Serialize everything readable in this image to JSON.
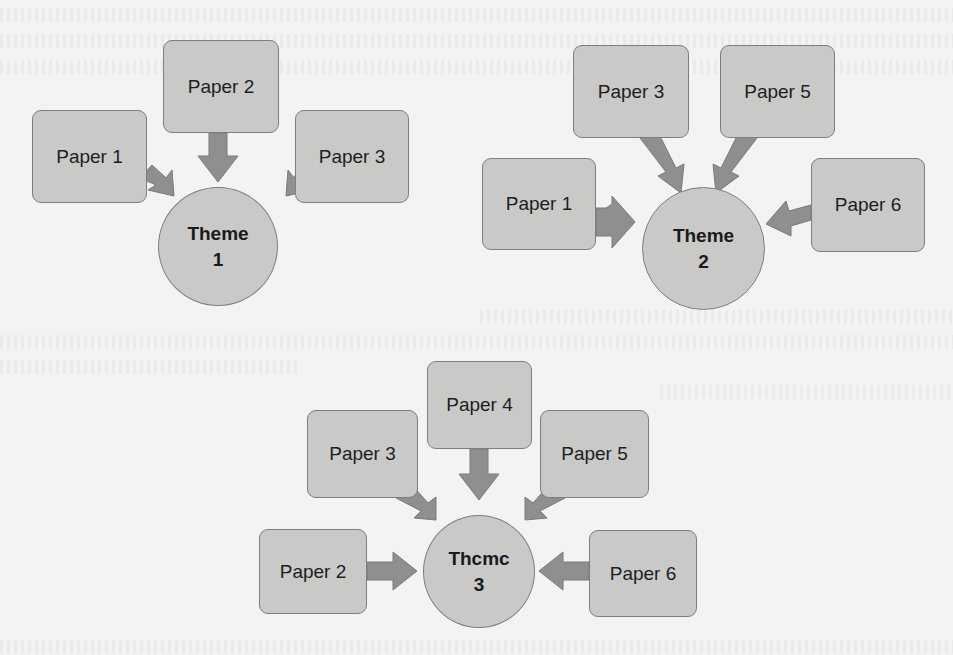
{
  "colors": {
    "box_fill": "#c9c9c7",
    "box_border": "#7e7e7e",
    "arrow": "#8f8f8f",
    "background": "#f3f3f1",
    "text": "#1e1e1e"
  },
  "groups": [
    {
      "theme": {
        "line1": "Theme",
        "line2": "1"
      },
      "papers": [
        {
          "label": "Paper 1"
        },
        {
          "label": "Paper 2"
        },
        {
          "label": "Paper 3"
        }
      ]
    },
    {
      "theme": {
        "line1": "Theme",
        "line2": "2"
      },
      "papers": [
        {
          "label": "Paper 1"
        },
        {
          "label": "Paper 3"
        },
        {
          "label": "Paper 5"
        },
        {
          "label": "Paper 6"
        }
      ]
    },
    {
      "theme": {
        "line1": "Thcmc",
        "line2": "3"
      },
      "papers": [
        {
          "label": "Paper 2"
        },
        {
          "label": "Paper 3"
        },
        {
          "label": "Paper 4"
        },
        {
          "label": "Paper 5"
        },
        {
          "label": "Paper 6"
        }
      ]
    }
  ]
}
